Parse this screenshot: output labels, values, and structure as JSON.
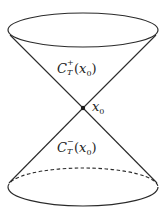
{
  "diagram": {
    "colors": {
      "stroke": "#2a2a2a",
      "background": "#ffffff"
    },
    "geometry": {
      "apex": {
        "x": 83,
        "y": 108
      },
      "top_ellipse": {
        "cx": 83,
        "cy": 30,
        "rx": 75,
        "ry": 17
      },
      "bottom_ellipse": {
        "cx": 83,
        "cy": 187,
        "rx": 75,
        "ry": 19,
        "back_half": "dashed"
      }
    },
    "labels": {
      "future_cone": {
        "symbol": "C",
        "superscript": "+",
        "subscript": "T",
        "argument_open": "(",
        "argument_var": "x",
        "argument_sub": "0",
        "argument_close": ")"
      },
      "past_cone": {
        "symbol": "C",
        "superscript": "−",
        "subscript": "T",
        "argument_open": "(",
        "argument_var": "x",
        "argument_sub": "0",
        "argument_close": ")"
      },
      "apex_point": {
        "var": "x",
        "sub": "0"
      }
    }
  }
}
